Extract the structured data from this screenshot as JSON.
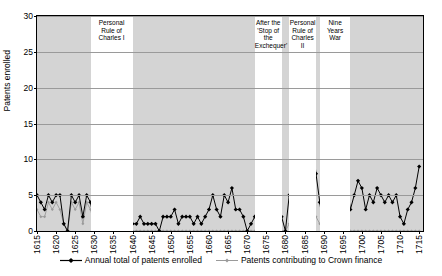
{
  "chart_data": {
    "type": "line",
    "title": "",
    "xlabel": "",
    "ylabel": "Patents enrolled",
    "xlim": [
      1615,
      1716
    ],
    "ylim": [
      0,
      30
    ],
    "yticks": [
      0,
      5,
      10,
      15,
      20,
      25,
      30
    ],
    "xticks": [
      1615,
      1620,
      1625,
      1630,
      1635,
      1640,
      1645,
      1650,
      1655,
      1660,
      1665,
      1670,
      1675,
      1680,
      1685,
      1690,
      1695,
      1700,
      1705,
      1710,
      1715
    ],
    "grid": true,
    "legend_position": "bottom",
    "x": [
      1615,
      1616,
      1617,
      1618,
      1619,
      1620,
      1621,
      1622,
      1623,
      1624,
      1625,
      1626,
      1627,
      1628,
      1629,
      1630,
      1631,
      1632,
      1633,
      1634,
      1635,
      1636,
      1637,
      1638,
      1639,
      1640,
      1641,
      1642,
      1643,
      1644,
      1645,
      1646,
      1647,
      1648,
      1649,
      1650,
      1651,
      1652,
      1653,
      1654,
      1655,
      1656,
      1657,
      1658,
      1659,
      1660,
      1661,
      1662,
      1663,
      1664,
      1665,
      1666,
      1667,
      1668,
      1669,
      1670,
      1671,
      1672,
      1673,
      1674,
      1675,
      1676,
      1677,
      1678,
      1679,
      1680,
      1681,
      1682,
      1683,
      1684,
      1685,
      1686,
      1687,
      1688,
      1689,
      1690,
      1691,
      1692,
      1693,
      1694,
      1695,
      1696,
      1697,
      1698,
      1699,
      1700,
      1701,
      1702,
      1703,
      1704,
      1705,
      1706,
      1707,
      1708,
      1709,
      1710,
      1711,
      1712,
      1713,
      1714,
      1715
    ],
    "series": [
      {
        "name": "Annual total of patents enrolled",
        "color": "#000000",
        "marker": "diamond",
        "values": [
          5,
          4,
          3,
          5,
          4,
          5,
          5,
          1,
          0,
          5,
          4,
          5,
          2,
          5,
          4,
          1,
          4,
          6,
          7,
          4,
          9,
          13,
          13,
          11,
          5,
          1,
          1,
          2,
          1,
          1,
          1,
          1,
          0,
          2,
          2,
          2,
          3,
          1,
          2,
          2,
          2,
          1,
          2,
          1,
          2,
          3,
          5,
          3,
          2,
          5,
          4,
          6,
          3,
          3,
          2,
          0,
          1,
          2,
          3,
          5,
          9,
          4,
          5,
          2,
          2,
          0,
          5,
          7,
          4,
          3,
          5,
          11,
          13,
          8,
          4,
          0,
          20,
          23,
          16,
          12,
          9,
          7,
          3,
          5,
          7,
          6,
          3,
          5,
          4,
          6,
          5,
          4,
          5,
          4,
          5,
          2,
          1,
          3,
          4,
          6,
          9
        ]
      },
      {
        "name": "Patents contributing to Crown finance",
        "color": "#9a9a9a",
        "marker": "diamond-small",
        "values": [
          3,
          2,
          2,
          4,
          3,
          4,
          3,
          1,
          0,
          4,
          3,
          4,
          1,
          4,
          3,
          1,
          3,
          5,
          5,
          3,
          7,
          11,
          11,
          9,
          2,
          0,
          0,
          0,
          0,
          0,
          0,
          0,
          0,
          0,
          0,
          0,
          0,
          0,
          0,
          0,
          0,
          0,
          0,
          0,
          0,
          0,
          0,
          0,
          0,
          0,
          0,
          0,
          0,
          0,
          0,
          0,
          0,
          0,
          1,
          2,
          3,
          1,
          1,
          0,
          0,
          0,
          1,
          1,
          0,
          0,
          1,
          2,
          3,
          2,
          1,
          0,
          0,
          0,
          0,
          0,
          0,
          0,
          0,
          0,
          0,
          0,
          0,
          0,
          0,
          0,
          0,
          0,
          0,
          0,
          0,
          0,
          0,
          0,
          0,
          0,
          0
        ]
      }
    ],
    "annotations": [
      {
        "text": "Personal Rule of Charles I",
        "lines": [
          "Personal",
          "Rule of",
          "Charles I"
        ],
        "start_year": 1629,
        "end_year": 1640
      },
      {
        "text": "After the 'Stop of the Exchequer'",
        "lines": [
          "After the",
          "'Stop of",
          "the",
          "Exchequer'"
        ],
        "start_year": 1672,
        "end_year": 1679
      },
      {
        "text": "Personal Rule of Charles II",
        "lines": [
          "Personal",
          "Rule of",
          "Charles II"
        ],
        "start_year": 1681,
        "end_year": 1688
      },
      {
        "text": "Nine Years War",
        "lines": [
          "Nine",
          "Years",
          "War"
        ],
        "start_year": 1689,
        "end_year": 1697
      }
    ]
  },
  "legend": {
    "items": [
      {
        "label": "Annual total of patents enrolled"
      },
      {
        "label": "Patents contributing to Crown finance"
      }
    ]
  }
}
